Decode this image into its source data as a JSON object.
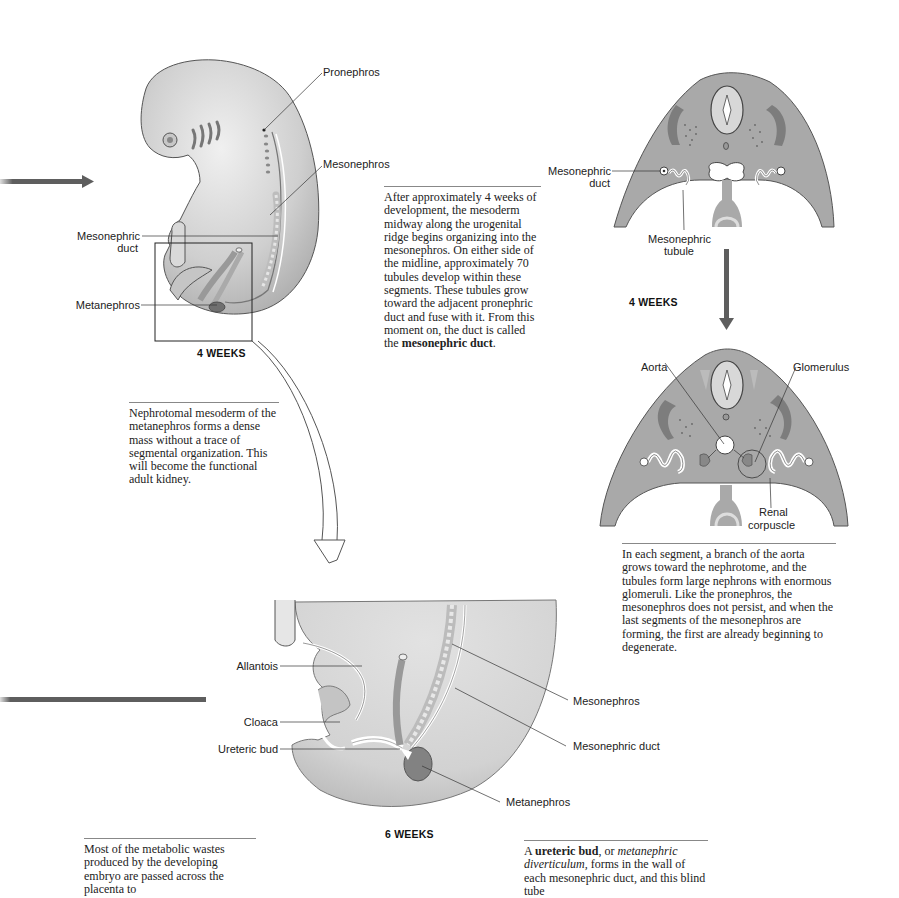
{
  "figure": {
    "embryo_4wk": {
      "stage_label": "4 WEEKS",
      "labels": {
        "pronephros": "Pronephros",
        "mesonephros": "Mesonephros",
        "mesonephric_duct_line1": "Mesonephric",
        "mesonephric_duct_line2": "duct",
        "metanephros": "Metanephros"
      }
    },
    "cross_section_upper": {
      "stage_label": "4 WEEKS",
      "labels": {
        "mesonephric_duct_line1": "Mesonephric",
        "mesonephric_duct_line2": "duct",
        "mesonephric_tubule_line1": "Mesonephric",
        "mesonephric_tubule_line2": "tubule"
      }
    },
    "cross_section_lower": {
      "labels": {
        "aorta": "Aorta",
        "glomerulus": "Glomerulus",
        "renal_corpuscle_line1": "Renal",
        "renal_corpuscle_line2": "corpuscle"
      }
    },
    "embryo_6wk": {
      "stage_label": "6 WEEKS",
      "labels": {
        "allantois": "Allantois",
        "cloaca": "Cloaca",
        "ureteric_bud": "Ureteric bud",
        "mesonephros": "Mesonephros",
        "mesonephric_duct": "Mesonephric duct",
        "metanephros": "Metanephros"
      }
    },
    "colors": {
      "tissue_gray": "#a9a9a9",
      "tissue_light": "#d6d6d6",
      "organ_dark": "#7d7d7d",
      "arrow_gray": "#5e5e5e",
      "outline": "#3a3a3a"
    }
  },
  "captions": {
    "mesonephros_4wk": {
      "text": "After approximately 4 weeks of development, the mesoderm midway along the urogenital ridge begins organizing into the mesonephros. On either side of the midline, approximately 70 tubules develop within these segments. These tubules grow toward the adjacent pronephric duct and fuse with it. From this moment on, the duct is called the ",
      "bold": "mesonephric duct",
      "tail": "."
    },
    "metanephros": {
      "text": "Nephrotomal mesoderm of the metanephros forms a dense mass without a trace of segmental organization. This will become the functional adult kidney."
    },
    "aorta_branch": {
      "text": "In each segment, a branch of the aorta grows toward the nephrotome, and the tubules form large nephrons with enormous glomeruli. Like the pronephros, the mesonephros does not persist, and when the last segments of the mesonephros are forming, the first are already beginning to degenerate."
    },
    "metabolic_wastes": {
      "text": "Most of the metabolic wastes produced by the developing embryo are passed across the placenta to"
    },
    "ureteric_bud": {
      "pre": "A ",
      "bold": "ureteric bud",
      "mid": ", or ",
      "italic": "metanephric diverticulum,",
      "post": " forms in the wall of each mesonephric duct, and this blind tube"
    }
  }
}
